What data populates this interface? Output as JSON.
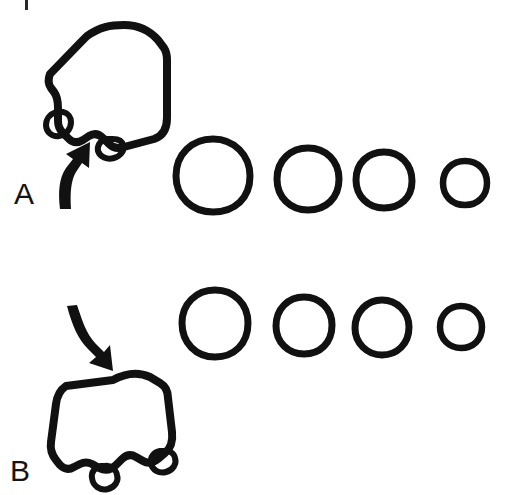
{
  "figure": {
    "background_color": "#ffffff",
    "ink_color": "#111111",
    "width": 509,
    "height": 495,
    "caption_artifact": "|"
  },
  "panels": [
    {
      "id": "A",
      "label": "A",
      "label_x": 14,
      "label_y": 204,
      "arrow": {
        "name": "curved-arrow-up",
        "direction": "up",
        "description": "curved arrow pointing up toward the blob"
      },
      "blob": {
        "name": "rounded-square-blob-with-two-lobes",
        "lobes": 2,
        "orientation": "tilted-right",
        "description": "hand drawn rounded square outline with two small foot lobes on lower edge"
      },
      "circles": [
        {
          "label": "circle-1",
          "cx": 213,
          "cy": 176,
          "r": 37
        },
        {
          "label": "circle-2",
          "cx": 308,
          "cy": 179,
          "r": 31
        },
        {
          "label": "circle-3",
          "cx": 384,
          "cy": 180,
          "r": 28
        },
        {
          "label": "circle-4",
          "cx": 465,
          "cy": 183,
          "r": 22
        }
      ]
    },
    {
      "id": "B",
      "label": "B",
      "label_x": 10,
      "label_y": 480,
      "arrow": {
        "name": "curved-arrow-down",
        "direction": "down",
        "description": "curved arrow pointing down toward the blob"
      },
      "blob": {
        "name": "rounded-square-blob-with-two-lobes",
        "lobes": 2,
        "orientation": "tilted-left",
        "description": "hand drawn rounded square outline with two small foot lobes on lower edge"
      },
      "circles": [
        {
          "label": "circle-1",
          "cx": 215,
          "cy": 323,
          "r": 33
        },
        {
          "label": "circle-2",
          "cx": 304,
          "cy": 325,
          "r": 28
        },
        {
          "label": "circle-3",
          "cx": 382,
          "cy": 327,
          "r": 27
        },
        {
          "label": "circle-4",
          "cx": 461,
          "cy": 327,
          "r": 21
        }
      ]
    }
  ]
}
